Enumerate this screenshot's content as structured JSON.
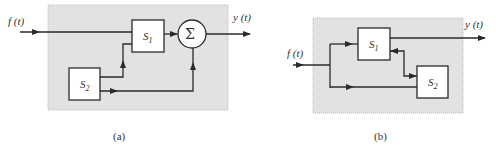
{
  "diagrams": [
    {
      "id": "a",
      "caption": "(a)",
      "input_label": "f (t)",
      "output_label": "y (t)",
      "blocks": [
        {
          "name": "S",
          "sub": "1"
        },
        {
          "name": "S",
          "sub": "2"
        }
      ],
      "summer_symbol": "Σ"
    },
    {
      "id": "b",
      "caption": "(b)",
      "input_label": "f (t)",
      "output_label": "y (t)",
      "blocks": [
        {
          "name": "S",
          "sub": "1"
        },
        {
          "name": "S",
          "sub": "2"
        }
      ]
    }
  ],
  "colors": {
    "panel": "#e2e2e2",
    "stroke": "#2a2a2a",
    "block_fill": "#ffffff"
  }
}
